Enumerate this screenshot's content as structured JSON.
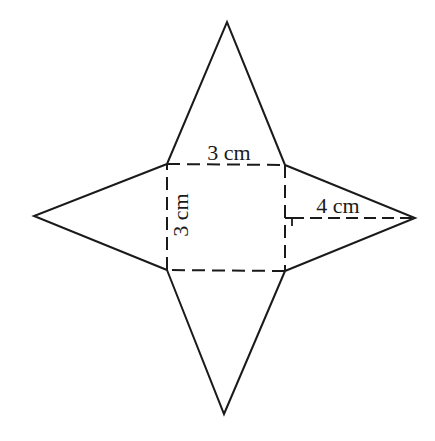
{
  "diagram": {
    "labels": {
      "base_top": "3 cm",
      "base_side": "3 cm",
      "slant_height": "4 cm"
    },
    "colors": {
      "stroke": "#1a1a1a",
      "background": "#ffffff"
    },
    "geometry": {
      "square": {
        "tl": [
          167,
          164
        ],
        "tr": [
          285,
          165
        ],
        "br": [
          285,
          271
        ],
        "bl": [
          167,
          270
        ]
      },
      "apexes": {
        "top": [
          227,
          22
        ],
        "right": [
          415,
          218
        ],
        "bottom": [
          224,
          414
        ],
        "left": [
          34,
          216
        ]
      }
    }
  }
}
